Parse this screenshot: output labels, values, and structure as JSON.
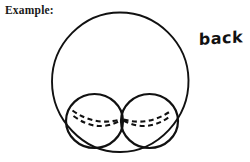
{
  "canvas": {
    "width": 250,
    "height": 162,
    "background_color": "#ffffff",
    "ink_color": "#111111"
  },
  "labels": {
    "caption": "Example:",
    "annotation": "back"
  },
  "figure": {
    "outer_circle": {
      "name": "large-outer-circle",
      "center_x": 120,
      "center_y": 82,
      "radius_x": 68,
      "radius_y": 70,
      "stroke_width": 1.9,
      "style": "solid"
    },
    "inner_circles": [
      {
        "name": "left-small-circle",
        "center_x": 94.5,
        "center_y": 121,
        "radius_x": 28.5,
        "radius_y": 27,
        "stroke_width": 2.2,
        "style": "solid"
      },
      {
        "name": "right-small-circle",
        "center_x": 149.5,
        "center_y": 121,
        "radius_x": 28.5,
        "radius_y": 27,
        "stroke_width": 2.2,
        "style": "solid"
      }
    ],
    "dashed_arcs": [
      {
        "name": "left-upper-dashed-arc",
        "path": "M 72 111 Q 96 126 120 119",
        "dash_pattern": "5 3.5",
        "stroke_width": 2.1
      },
      {
        "name": "left-lower-dashed-arc",
        "path": "M 73 116 Q 97 133 120 120",
        "dash_pattern": "5 3.5",
        "stroke_width": 2.1
      },
      {
        "name": "right-upper-dashed-arc",
        "path": "M 124 119 Q 148 126 172 111",
        "dash_pattern": "5 3.5",
        "stroke_width": 2.1
      },
      {
        "name": "right-lower-dashed-arc",
        "path": "M 124 120 Q 147 133 171 116",
        "dash_pattern": "5 3.5",
        "stroke_width": 2.1
      }
    ]
  }
}
